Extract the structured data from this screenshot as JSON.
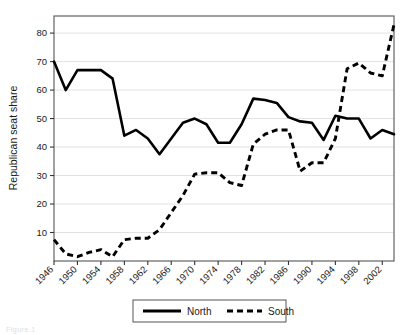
{
  "chart_data": {
    "type": "line",
    "title": "",
    "xlabel": "",
    "ylabel": "Republican seat share",
    "xlim": [
      1946,
      2004
    ],
    "ylim": [
      0,
      86
    ],
    "yticks": [
      10,
      20,
      30,
      40,
      50,
      60,
      70,
      80
    ],
    "xticks": [
      1946,
      1950,
      1954,
      1958,
      1962,
      1966,
      1970,
      1974,
      1978,
      1982,
      1986,
      1990,
      1994,
      1998,
      2002
    ],
    "grid": "horizontal",
    "legend_position": "below",
    "x": [
      1946,
      1948,
      1950,
      1952,
      1954,
      1956,
      1958,
      1960,
      1962,
      1964,
      1966,
      1968,
      1970,
      1972,
      1974,
      1976,
      1978,
      1980,
      1982,
      1984,
      1986,
      1988,
      1990,
      1992,
      1994,
      1996,
      1998,
      2000,
      2002,
      2004
    ],
    "series": [
      {
        "name": "North",
        "style": "solid",
        "color": "#000000",
        "values": [
          70,
          60,
          67,
          67,
          67,
          64,
          44,
          46,
          43,
          37.5,
          43,
          48.5,
          50,
          48,
          41.5,
          41.5,
          48,
          57,
          56.5,
          55.5,
          50.5,
          49,
          48.5,
          42.5,
          51,
          50,
          50,
          43,
          46,
          44.5
        ]
      },
      {
        "name": "South",
        "style": "dashed",
        "color": "#000000",
        "values": [
          7.5,
          2.5,
          1.5,
          3,
          4,
          1.5,
          7.5,
          8,
          8,
          11,
          17,
          23,
          30.5,
          31,
          31,
          27.5,
          26.5,
          41,
          44.5,
          46,
          46,
          31.5,
          34.5,
          34.5,
          43,
          67.5,
          69.5,
          66,
          65,
          83
        ]
      }
    ]
  },
  "legend": {
    "entries": [
      {
        "label": "North",
        "style": "solid"
      },
      {
        "label": "South",
        "style": "dashed"
      }
    ]
  },
  "caption": {
    "text": "Figure 1"
  }
}
